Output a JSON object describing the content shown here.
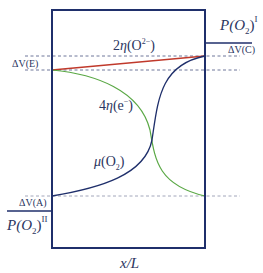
{
  "diagram": {
    "x_axis_label": "x/L",
    "levels": {
      "dV_C": "ΔV(C)",
      "dV_E": "ΔV(E)",
      "dV_A": "ΔV(A)"
    },
    "pressures": {
      "p1_base": "P(O",
      "p1_sub": "2",
      "p1_close": ")",
      "p1_sup": "I",
      "p2_base": "P(O",
      "p2_sub": "2",
      "p2_close": ")",
      "p2_sup": "II"
    },
    "curves": [
      {
        "id": "eta_O2minus",
        "label_prefix": "2",
        "label_sym": "η",
        "label_paren": "(O",
        "label_sup": "2−",
        "label_close": ")",
        "color": "#c0392b"
      },
      {
        "id": "eta_e",
        "label_prefix": "4",
        "label_sym": "η",
        "label_paren": "(e",
        "label_sup": "−",
        "label_close": ")",
        "color": "#5aa845"
      },
      {
        "id": "mu_O2",
        "label_sym": "μ",
        "label_paren": "(O",
        "label_sub": "2",
        "label_close": ")",
        "color": "#1f2f6b"
      }
    ],
    "colors": {
      "frame": "#1f2f6b",
      "dashed": "#4a5480",
      "red": "#c0392b",
      "green": "#5aa845",
      "blue": "#1f2f6b"
    }
  }
}
